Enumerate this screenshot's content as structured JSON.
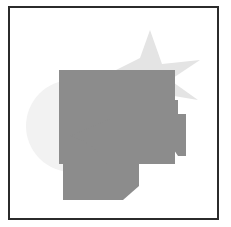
{
  "figure": {
    "canvas": {
      "width": 231,
      "height": 227,
      "background_color": "#ffffff"
    },
    "frame": {
      "border_color": "#2b2b2b",
      "border_width_px": 2,
      "fill_color": "#ffffff"
    },
    "palette": {
      "dark_gray": "#8c8c8c",
      "light_gray": "#e4e4e4",
      "very_light_gray": "#f2f2f2",
      "outline": "#2b2b2b"
    },
    "shapes": [
      {
        "name": "star",
        "kind": "star",
        "fill": "#e4e4e4",
        "z_order": 1,
        "points": "140,22 152,56 190,52 160,72 188,92 152,86 140,84 126,66 106,62 130,50"
      },
      {
        "name": "circle",
        "kind": "circle",
        "fill": "#f2f2f2",
        "z_order": 2,
        "cx": 62,
        "cy": 118,
        "r": 46
      },
      {
        "name": "notched-polygon",
        "kind": "polygon",
        "fill": "#8c8c8c",
        "z_order": 3,
        "points": "96,92 168,92 168,106 176,106 176,148 168,148 160,136 160,156 96,156"
      },
      {
        "name": "rectangle",
        "kind": "rectangle",
        "fill": "#8c8c8c",
        "z_order": 4,
        "x": 49,
        "y": 62,
        "width": 116,
        "height": 94
      },
      {
        "name": "pie-wedge",
        "kind": "pie",
        "fill": "#8c8c8c",
        "z_order": 5,
        "path": "M 102 110 L 102 168 A 58 58 0 0 0 60 128 Z"
      },
      {
        "name": "bottom-polygon",
        "kind": "polygon",
        "fill": "#8c8c8c",
        "z_order": 6,
        "points": "53,156 129,156 129,178 113,192 53,192"
      }
    ]
  }
}
